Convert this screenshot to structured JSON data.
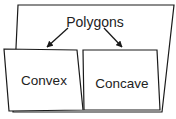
{
  "diagram": {
    "type": "hierarchy",
    "colors": {
      "stroke": "#1a1a1a",
      "fill": "#ffffff",
      "text": "#222222"
    },
    "parent": {
      "label": "Polygons"
    },
    "children": [
      {
        "label": "Convex"
      },
      {
        "label": "Concave"
      }
    ],
    "edges": [
      {
        "from": "Polygons",
        "to": "Convex"
      },
      {
        "from": "Polygons",
        "to": "Concave"
      }
    ]
  }
}
